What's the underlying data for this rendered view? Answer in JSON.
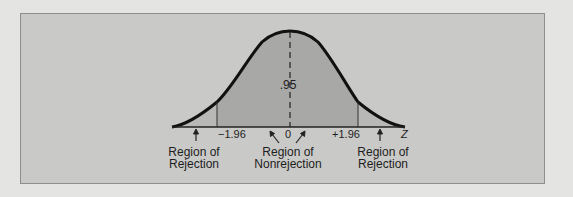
{
  "figure": {
    "center_area_label": ".95",
    "axis_label": "Z",
    "ticks": [
      {
        "value": -1.96,
        "label": "−1.96"
      },
      {
        "value": 0,
        "label": "0"
      },
      {
        "value": 1.96,
        "label": "+1.96"
      }
    ],
    "regions": [
      {
        "name": "left-rejection",
        "line1": "Region of",
        "line2": "Rejection"
      },
      {
        "name": "nonrejection",
        "line1": "Region of",
        "line2": "Nonrejection"
      },
      {
        "name": "right-rejection",
        "line1": "Region of",
        "line2": "Rejection"
      }
    ]
  },
  "colors": {
    "background": "#e4e4e2",
    "panel": "#c9c9c7",
    "shaded_area": "#a8a8a6",
    "curve": "#111111"
  }
}
